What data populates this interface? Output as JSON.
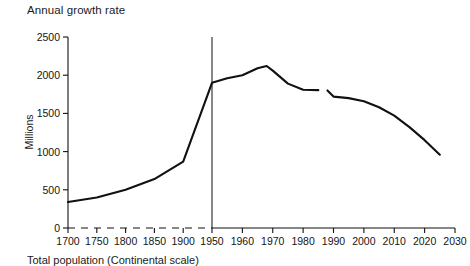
{
  "chart_data": {
    "type": "line",
    "title": "Annual growth rate",
    "caption": "Total population (Continental scale)",
    "xlabel": "",
    "ylabel": "Millions",
    "grid": false,
    "legend": "none",
    "ylim": [
      0,
      2500
    ],
    "yticks": [
      0,
      500,
      1000,
      1500,
      2000,
      2500
    ],
    "ytick_labels": [
      "0",
      "500",
      "1000",
      "1500",
      "2000",
      "2500"
    ],
    "xticks": [
      1700,
      1750,
      1800,
      1850,
      1900,
      1950,
      1960,
      1970,
      1980,
      1990,
      2000,
      2010,
      2020,
      2030
    ],
    "xtick_labels": [
      "1700",
      "1750",
      "1800",
      "1850",
      "1900",
      "1950",
      "1960",
      "1970",
      "1980",
      "1990",
      "2000",
      "2010",
      "2020",
      "2030"
    ],
    "x_axis_note": "piecewise scale: 50-year steps to 1950, then 10-year steps",
    "annotations": [
      {
        "name": "vertical-divider",
        "x": 1950,
        "y_from": 0,
        "y_to": 2500
      },
      {
        "name": "dashed-baseline",
        "y": 0,
        "x_from": 1700,
        "x_to": 1950
      },
      {
        "name": "series-gap",
        "x_from": 1985,
        "x_to": 1988
      }
    ],
    "series": [
      {
        "name": "Annual growth rate",
        "x": [
          1700,
          1750,
          1800,
          1850,
          1900,
          1950,
          1955,
          1960,
          1965,
          1968,
          1970,
          1975,
          1980,
          1985,
          1988,
          1990,
          1995,
          2000,
          2005,
          2010,
          2015,
          2020,
          2025
        ],
        "values": [
          340,
          400,
          500,
          640,
          870,
          1900,
          1960,
          2000,
          2090,
          2120,
          2060,
          1890,
          1810,
          1805,
          1800,
          1720,
          1700,
          1660,
          1580,
          1470,
          1320,
          1150,
          960
        ]
      }
    ]
  }
}
